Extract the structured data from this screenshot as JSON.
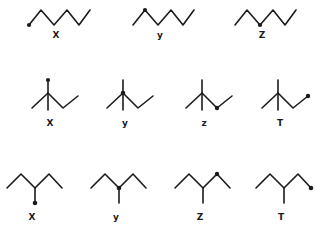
{
  "figure": {
    "background_color": "#ffffff",
    "ink_color": "#1b1b1b",
    "type": "chemistry-skeletal-structures",
    "rows": [
      {
        "row_index": 1,
        "skeleton": "unbranched-zigzag-hexyl",
        "items": [
          {
            "label": "X",
            "radical_position": "terminal-left-bottom-vertex",
            "vertices": "6-carbon zigzag starting low-left",
            "dot": true
          },
          {
            "label": "y",
            "radical_position": "second-carbon-first-peak",
            "vertices": "6-carbon zigzag starting low-left",
            "dot": true
          },
          {
            "label": "Z",
            "radical_position": "third-carbon-first-valley",
            "vertices": "6-carbon zigzag starting low-left",
            "dot": true
          }
        ]
      },
      {
        "row_index": 2,
        "skeleton": "branched-isopentyl-tertiary-center-with-vertical-methyl",
        "items": [
          {
            "label": "X",
            "radical_position": "top-of-vertical-methyl",
            "dot": true
          },
          {
            "label": "y",
            "radical_position": "central-tertiary-carbon",
            "dot": true
          },
          {
            "label": "z",
            "radical_position": "right-lower-valley-vertex",
            "dot": true
          },
          {
            "label": "T",
            "radical_position": "terminal-right-end",
            "dot": true
          }
        ]
      },
      {
        "row_index": 3,
        "skeleton": "3-methylpentane-W-shape-with-downward-methyl",
        "items": [
          {
            "label": "X",
            "radical_position": "bottom-of-downward-methyl",
            "dot": true
          },
          {
            "label": "y",
            "radical_position": "central-carbon-junction",
            "dot": true
          },
          {
            "label": "Z",
            "radical_position": "right-peak-vertex",
            "dot": true
          },
          {
            "label": "T",
            "radical_position": "terminal-right-end",
            "dot": true
          }
        ]
      }
    ]
  }
}
